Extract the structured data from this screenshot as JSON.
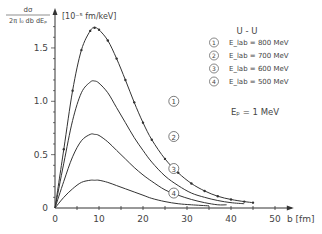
{
  "chart_data": {
    "type": "line",
    "title": "",
    "ylabel_numerator": "dσ",
    "ylabel_denominator": "2π l₀ db dEₚ",
    "yunit": "[10⁻⁵ fm/keV]",
    "xlabel": "b [fm]",
    "xlim": [
      0,
      52
    ],
    "ylim": [
      0,
      1.75
    ],
    "xticks": [
      0,
      10,
      20,
      30,
      40,
      50
    ],
    "xtick_labels": [
      "0",
      "10",
      "20",
      "30",
      "40",
      "50"
    ],
    "yticks": [
      0,
      0.5,
      1.0,
      1.5
    ],
    "ytick_labels": [
      "0",
      "0.5",
      "1.0",
      "1.5"
    ],
    "grid": false,
    "legend_position": "upper right",
    "legend_title": "U - U",
    "annotation": "Eₚ = 1 MeV",
    "series": [
      {
        "name": "E_lab = 800 MeV",
        "marker_label": "1",
        "markers": true,
        "x": [
          0,
          2,
          4,
          6,
          8,
          9,
          10,
          12,
          14,
          16,
          18,
          20,
          22,
          25,
          28,
          31,
          34,
          37,
          40,
          43,
          45
        ],
        "y": [
          0,
          0.55,
          1.1,
          1.48,
          1.66,
          1.69,
          1.67,
          1.57,
          1.4,
          1.2,
          0.99,
          0.8,
          0.64,
          0.46,
          0.33,
          0.23,
          0.16,
          0.11,
          0.08,
          0.06,
          0.05
        ]
      },
      {
        "name": "E_lab = 700 MeV",
        "marker_label": "2",
        "markers": false,
        "x": [
          0,
          2,
          4,
          6,
          8,
          9,
          10,
          12,
          14,
          16,
          18,
          20,
          22,
          25,
          28,
          31,
          34,
          37,
          40,
          43
        ],
        "y": [
          0,
          0.42,
          0.82,
          1.08,
          1.18,
          1.19,
          1.17,
          1.08,
          0.94,
          0.8,
          0.66,
          0.54,
          0.43,
          0.3,
          0.21,
          0.14,
          0.1,
          0.07,
          0.05,
          0.04
        ]
      },
      {
        "name": "E_lab = 600 MeV",
        "marker_label": "3",
        "markers": false,
        "x": [
          0,
          2,
          4,
          6,
          8,
          9,
          10,
          12,
          14,
          16,
          18,
          20,
          22,
          25,
          28,
          31,
          34,
          37,
          39
        ],
        "y": [
          0,
          0.25,
          0.48,
          0.63,
          0.69,
          0.69,
          0.68,
          0.62,
          0.54,
          0.46,
          0.38,
          0.31,
          0.25,
          0.17,
          0.12,
          0.08,
          0.05,
          0.03,
          0.03
        ]
      },
      {
        "name": "E_lab = 500 MeV",
        "marker_label": "4",
        "markers": false,
        "x": [
          0,
          2,
          4,
          6,
          8,
          9,
          10,
          12,
          14,
          16,
          18,
          20,
          22,
          25,
          28,
          31,
          35
        ],
        "y": [
          0,
          0.1,
          0.18,
          0.24,
          0.26,
          0.26,
          0.26,
          0.24,
          0.21,
          0.18,
          0.15,
          0.12,
          0.09,
          0.06,
          0.04,
          0.03,
          0.02
        ]
      }
    ],
    "curve_labels": [
      {
        "text": "1",
        "x": 27,
        "y": 1.0
      },
      {
        "text": "2",
        "x": 27,
        "y": 0.67
      },
      {
        "text": "3",
        "x": 27,
        "y": 0.37
      },
      {
        "text": "4",
        "x": 27,
        "y": 0.14
      }
    ]
  }
}
